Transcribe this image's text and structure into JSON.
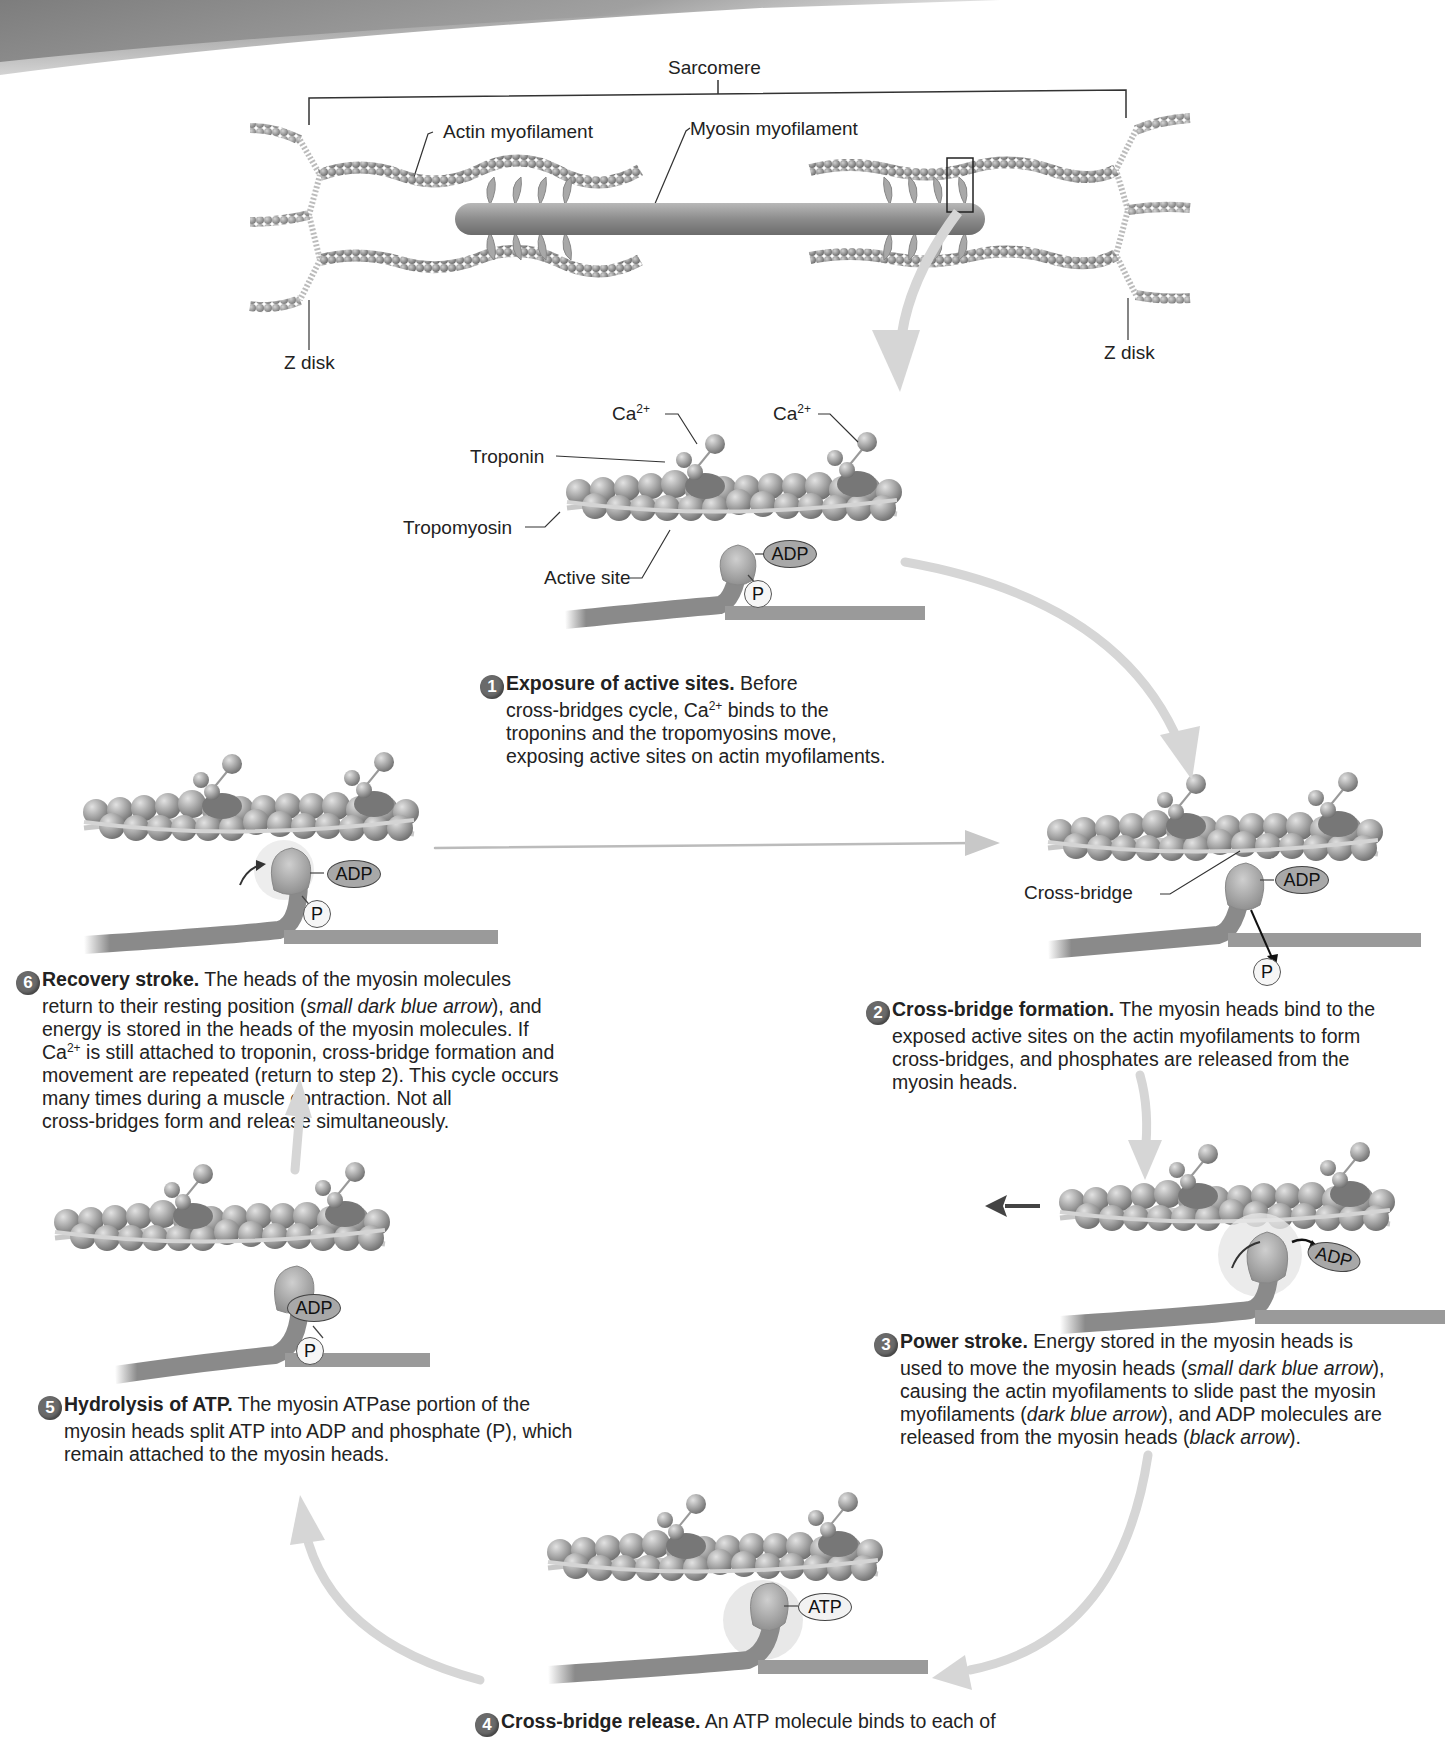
{
  "sarcomere": {
    "title": "Sarcomere",
    "labels": {
      "actin": "Actin myofilament",
      "myosin": "Myosin myofilament",
      "z_disk_left": "Z disk",
      "z_disk_right": "Z disk"
    }
  },
  "detail_labels": {
    "ca_left": "Ca",
    "ca_right": "Ca",
    "ca_charge": "2+",
    "troponin": "Troponin",
    "tropomyosin": "Tropomyosin",
    "active_site": "Active site",
    "cross_bridge": "Cross-bridge"
  },
  "molecules": {
    "adp": "ADP",
    "atp": "ATP",
    "phosphate": "P"
  },
  "steps": [
    {
      "number": "1",
      "title": "Exposure of active sites.",
      "text_parts": [
        "Before",
        "cross-bridges cycle, Ca",
        "2+",
        " binds to the",
        "troponins and the tropomyosins move,",
        "exposing active sites on actin myofilaments."
      ]
    },
    {
      "number": "2",
      "title": "Cross-bridge formation.",
      "text_parts": [
        "The myosin heads bind to the",
        "exposed active sites on the actin myofilaments to form",
        "cross-bridges, and phosphates are released from the",
        "myosin heads."
      ]
    },
    {
      "number": "3",
      "title": "Power stroke.",
      "text_parts": [
        "Energy stored in the myosin heads is",
        "used to move the myosin heads (",
        "small dark blue arrow",
        "),",
        "causing the actin myofilaments to slide past the myosin",
        "myofilaments (",
        "dark blue arrow",
        "), and ADP molecules are",
        "released from the myosin heads (",
        "black arrow",
        ")."
      ]
    },
    {
      "number": "4",
      "title": "Cross-bridge release.",
      "text_parts": [
        "An ATP molecule binds to each of"
      ]
    },
    {
      "number": "5",
      "title": "Hydrolysis of ATP.",
      "text_parts": [
        "The myosin ATPase portion of the",
        "myosin heads split ATP into ADP and phosphate (P), which",
        "remain attached to the myosin heads."
      ]
    },
    {
      "number": "6",
      "title": "Recovery stroke.",
      "text_parts": [
        "The heads of the myosin molecules",
        "return to their resting position (",
        "small dark blue arrow",
        "), and",
        "energy is stored in the heads of the myosin molecules. If",
        "Ca",
        "2+",
        " is still attached to troponin, cross-bridge formation and",
        "movement are repeated (return to step 2). This cycle occurs",
        "many times during a muscle contraction. Not all",
        "cross-bridges form and release simultaneously."
      ]
    }
  ],
  "colors": {
    "actin_bead": "#9a9a9a",
    "myosin": "#8f8f8f",
    "cycle_arrow": "#d8d8d8",
    "header_band": "#8a8a8a",
    "number_badge": "#6a6a6a"
  }
}
